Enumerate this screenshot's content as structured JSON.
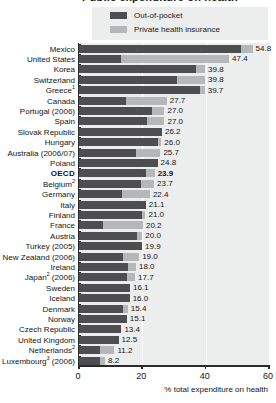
{
  "title": "Public expenditure on health",
  "legend": {
    "position": "top",
    "items": [
      {
        "label": "Out-of-pocket",
        "color": "#4e4e50",
        "key": "out_of_pocket"
      },
      {
        "label": "Private health insurance",
        "color": "#b6b7b8",
        "key": "private_health_insurance"
      }
    ]
  },
  "axis": {
    "xlabel": "% total expenditure on health",
    "ticks": [
      "0",
      "20",
      "40",
      "60"
    ]
  },
  "chart_data": {
    "type": "bar",
    "orientation": "horizontal",
    "stacked": true,
    "title": "Public expenditure on health",
    "xlabel": "% total expenditure on health",
    "ylabel": "",
    "xlim": [
      0,
      60
    ],
    "xticks": [
      0,
      20,
      40,
      60
    ],
    "grid": "vertical",
    "legend_position": "top",
    "series": [
      {
        "name": "Out-of-pocket",
        "color": "#4e4e50",
        "values": [
          51.3,
          13.2,
          36.9,
          30.8,
          38.1,
          14.9,
          23.0,
          21.5,
          26.2,
          25.0,
          18.0,
          24.8,
          21.3,
          19.6,
          13.5,
          21.1,
          19.8,
          7.6,
          18.2,
          19.9,
          14.0,
          15.4,
          15.0,
          16.1,
          16.0,
          13.8,
          15.1,
          13.4,
          12.5,
          6.6,
          6.7
        ]
      },
      {
        "name": "Private health insurance",
        "color": "#b6b7b8",
        "values": [
          3.5,
          34.2,
          2.9,
          9.0,
          1.6,
          12.8,
          4.0,
          5.5,
          0.0,
          1.0,
          7.7,
          0.0,
          2.6,
          4.1,
          8.9,
          0.0,
          1.2,
          12.6,
          1.8,
          0.0,
          5.0,
          2.6,
          2.7,
          0.0,
          0.0,
          1.6,
          0.0,
          0.0,
          0.0,
          4.6,
          1.5
        ]
      }
    ],
    "categories": [
      "Mexico",
      "United States",
      "Korea",
      "Switzerland",
      "Greece¹",
      "Canada",
      "Portugal (2006)",
      "Spain",
      "Slovak Republic",
      "Hungary",
      "Australia (2006/07)",
      "Poland",
      "OECD",
      "Belgium²",
      "Germany",
      "Italy",
      "Finland",
      "France",
      "Austria",
      "Turkey (2005)",
      "New Zealand (2006)",
      "Ireland",
      "Japan² (2006)",
      "Sweden",
      "Iceland",
      "Denmark",
      "Norway",
      "Czech Republic",
      "United Kingdom",
      "Netherlands²",
      "Luxembourg³ (2006)"
    ],
    "totals": [
      54.8,
      47.4,
      39.8,
      39.8,
      39.7,
      27.7,
      27.0,
      27.0,
      26.2,
      26.0,
      25.7,
      24.8,
      23.9,
      23.7,
      22.4,
      21.1,
      21.0,
      20.2,
      20.0,
      19.9,
      19.0,
      18.0,
      17.7,
      16.1,
      16.0,
      15.4,
      15.1,
      13.4,
      12.5,
      11.2,
      8.2
    ]
  },
  "rows": [
    {
      "label": "Mexico",
      "sup": "",
      "total": "54.8",
      "dark": 51.3,
      "light": 3.5,
      "highlight": false
    },
    {
      "label": "United States",
      "sup": "",
      "total": "47.4",
      "dark": 13.2,
      "light": 34.2,
      "highlight": false
    },
    {
      "label": "Korea",
      "sup": "",
      "total": "39.8",
      "dark": 36.9,
      "light": 2.9,
      "highlight": false
    },
    {
      "label": "Switzerland",
      "sup": "",
      "total": "39.8",
      "dark": 30.8,
      "light": 9.0,
      "highlight": false
    },
    {
      "label": "Greece",
      "sup": "1",
      "total": "39.7",
      "dark": 38.1,
      "light": 1.6,
      "highlight": false
    },
    {
      "label": "Canada",
      "sup": "",
      "total": "27.7",
      "dark": 14.9,
      "light": 12.8,
      "highlight": false
    },
    {
      "label": "Portugal (2006)",
      "sup": "",
      "total": "27.0",
      "dark": 23.0,
      "light": 4.0,
      "highlight": false
    },
    {
      "label": "Spain",
      "sup": "",
      "total": "27.0",
      "dark": 21.5,
      "light": 5.5,
      "highlight": false
    },
    {
      "label": "Slovak Republic",
      "sup": "",
      "total": "26.2",
      "dark": 26.2,
      "light": 0.0,
      "highlight": false
    },
    {
      "label": "Hungary",
      "sup": "",
      "total": "26.0",
      "dark": 25.0,
      "light": 1.0,
      "highlight": false
    },
    {
      "label": "Australia (2006/07)",
      "sup": "",
      "total": "25.7",
      "dark": 18.0,
      "light": 7.7,
      "highlight": false
    },
    {
      "label": "Poland",
      "sup": "",
      "total": "24.8",
      "dark": 24.8,
      "light": 0.0,
      "highlight": false
    },
    {
      "label": "OECD",
      "sup": "",
      "total": "23.9",
      "dark": 21.3,
      "light": 2.6,
      "highlight": true
    },
    {
      "label": "Belgium",
      "sup": "2",
      "total": "23.7",
      "dark": 19.6,
      "light": 4.1,
      "highlight": false
    },
    {
      "label": "Germany",
      "sup": "",
      "total": "22.4",
      "dark": 13.5,
      "light": 8.9,
      "highlight": false
    },
    {
      "label": "Italy",
      "sup": "",
      "total": "21.1",
      "dark": 21.1,
      "light": 0.0,
      "highlight": false
    },
    {
      "label": "Finland",
      "sup": "",
      "total": "21.0",
      "dark": 19.8,
      "light": 1.2,
      "highlight": false
    },
    {
      "label": "France",
      "sup": "",
      "total": "20.2",
      "dark": 7.6,
      "light": 12.6,
      "highlight": false
    },
    {
      "label": "Austria",
      "sup": "",
      "total": "20.0",
      "dark": 18.2,
      "light": 1.8,
      "highlight": false
    },
    {
      "label": "Turkey (2005)",
      "sup": "",
      "total": "19.9",
      "dark": 19.9,
      "light": 0.0,
      "highlight": false
    },
    {
      "label": "New Zealand (2006)",
      "sup": "",
      "total": "19.0",
      "dark": 14.0,
      "light": 5.0,
      "highlight": false
    },
    {
      "label": "Ireland",
      "sup": "",
      "total": "18.0",
      "dark": 15.4,
      "light": 2.6,
      "highlight": false
    },
    {
      "label": "Japan (2006)",
      "sup": "2",
      "total": "17.7",
      "dark": 15.0,
      "light": 2.7,
      "highlight": false
    },
    {
      "label": "Sweden",
      "sup": "",
      "total": "16.1",
      "dark": 16.1,
      "light": 0.0,
      "highlight": false
    },
    {
      "label": "Iceland",
      "sup": "",
      "total": "16.0",
      "dark": 16.0,
      "light": 0.0,
      "highlight": false
    },
    {
      "label": "Denmark",
      "sup": "",
      "total": "15.4",
      "dark": 13.8,
      "light": 1.6,
      "highlight": false
    },
    {
      "label": "Norway",
      "sup": "",
      "total": "15.1",
      "dark": 15.1,
      "light": 0.0,
      "highlight": false
    },
    {
      "label": "Czech Republic",
      "sup": "",
      "total": "13.4",
      "dark": 13.4,
      "light": 0.0,
      "highlight": false
    },
    {
      "label": "United Kingdom",
      "sup": "",
      "total": "12.5",
      "dark": 12.5,
      "light": 0.0,
      "highlight": false
    },
    {
      "label": "Netherlands",
      "sup": "2",
      "total": "11.2",
      "dark": 6.6,
      "light": 4.6,
      "highlight": false
    },
    {
      "label": "Luxembourg (2006)",
      "sup": "3",
      "total": "8.2",
      "dark": 6.7,
      "light": 1.5,
      "highlight": false
    }
  ]
}
